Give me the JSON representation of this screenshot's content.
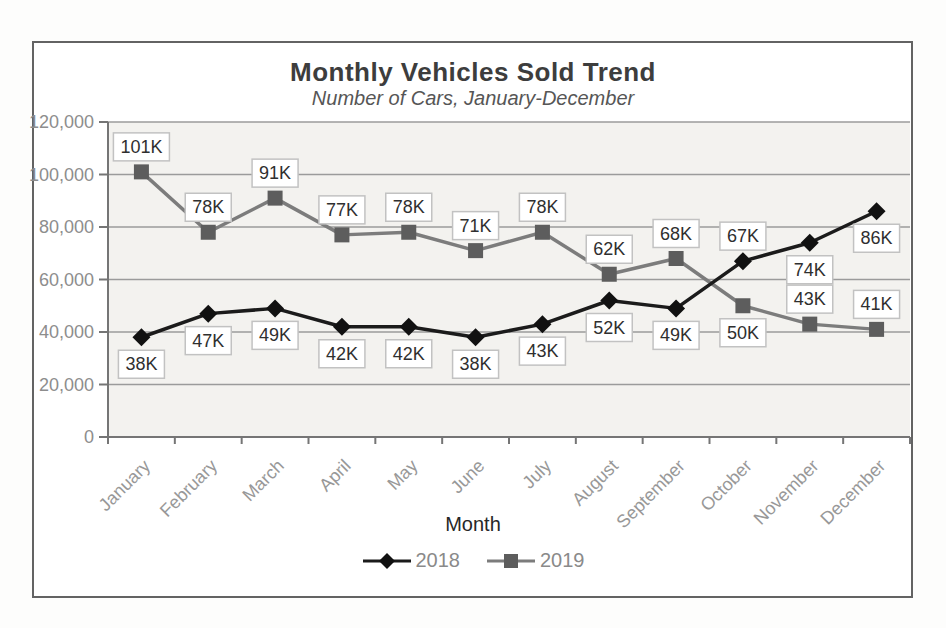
{
  "chart_data": {
    "type": "line",
    "title": "Monthly Vehicles Sold Trend",
    "subtitle": "Number of Cars, January-December",
    "xlabel": "Month",
    "ylabel": "",
    "categories": [
      "January",
      "February",
      "March",
      "April",
      "May",
      "June",
      "July",
      "August",
      "September",
      "October",
      "November",
      "December"
    ],
    "series": [
      {
        "name": "2018",
        "marker": "diamond",
        "color": "#1b1b1b",
        "marker_color": "#111111",
        "values": [
          38000,
          47000,
          49000,
          42000,
          42000,
          38000,
          43000,
          52000,
          49000,
          67000,
          74000,
          86000
        ],
        "labels": [
          "38K",
          "47K",
          "49K",
          "42K",
          "42K",
          "38K",
          "43K",
          "52K",
          "49K",
          "67K",
          "74K",
          "86K"
        ],
        "label_position": [
          "below",
          "below",
          "below",
          "below",
          "below",
          "below",
          "below",
          "below",
          "below",
          "above",
          "below",
          "below"
        ]
      },
      {
        "name": "2019",
        "marker": "square",
        "color": "#7c7c7c",
        "marker_color": "#5d5d5d",
        "values": [
          101000,
          78000,
          91000,
          77000,
          78000,
          71000,
          78000,
          62000,
          68000,
          50000,
          43000,
          41000
        ],
        "labels": [
          "101K",
          "78K",
          "91K",
          "77K",
          "78K",
          "71K",
          "78K",
          "62K",
          "68K",
          "50K",
          "43K",
          "41K"
        ],
        "label_position": [
          "above",
          "above",
          "above",
          "above",
          "above",
          "above",
          "above",
          "above",
          "above",
          "below",
          "above",
          "above"
        ]
      }
    ],
    "y_axis": {
      "min": 0,
      "max": 120000,
      "step": 20000,
      "tick_labels": [
        "0",
        "20,000",
        "40,000",
        "60,000",
        "80,000",
        "100,000",
        "120,000"
      ]
    },
    "grid": true,
    "legend_position": "bottom",
    "colors": {
      "plot_background": "#f3f2ef",
      "gridline": "#9b9b9b",
      "axis": "#757575",
      "tick_label": "#8d8d8d",
      "month_label": "#989898",
      "label_box_fill": "#ffffff",
      "label_box_border": "#c2c2c2",
      "label_text": "#2f2f2f"
    }
  }
}
